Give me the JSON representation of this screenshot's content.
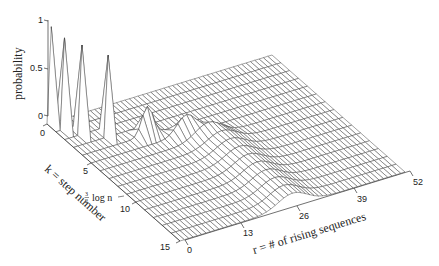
{
  "chart_data": {
    "type": "surface3d",
    "title": "",
    "zlabel": "probability",
    "xlabel": "k = step number",
    "ylabel": "r = # of rising sequences",
    "annotation": "3/2 log n",
    "z_ticks": [
      "0",
      "0.5",
      "1"
    ],
    "k_ticks": [
      "0",
      "5",
      "10",
      "15"
    ],
    "r_ticks": [
      "0",
      "13",
      "26",
      "39",
      "52"
    ],
    "zlim": [
      0,
      1
    ],
    "klim": [
      0,
      15
    ],
    "rlim": [
      0,
      52
    ],
    "grid": false,
    "peaks": [
      {
        "k": 0,
        "r": 1,
        "p": 1.0
      },
      {
        "k": 1,
        "r": 2,
        "p": 0.95
      },
      {
        "k": 2,
        "r": 4,
        "p": 0.93
      },
      {
        "k": 3,
        "r": 8,
        "p": 0.85
      },
      {
        "k": 4,
        "r": 16,
        "p": 0.3
      },
      {
        "k": 5,
        "r": 22,
        "p": 0.22
      },
      {
        "k": 6,
        "r": 25,
        "p": 0.18
      },
      {
        "k": 7,
        "r": 26,
        "p": 0.16
      },
      {
        "k": 8,
        "r": 26,
        "p": 0.15
      },
      {
        "k": 15,
        "r": 26,
        "p": 0.14
      }
    ]
  }
}
